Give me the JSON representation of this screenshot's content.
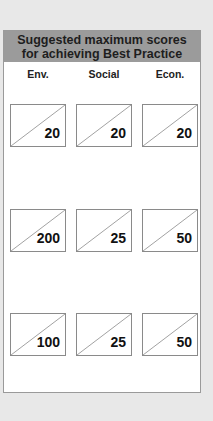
{
  "header": {
    "line1": "Suggested maximum scores",
    "line2": "for achieving Best Practice"
  },
  "columns": [
    "Env.",
    "Social",
    "Econ."
  ],
  "rows": [
    [
      "20",
      "20",
      "20"
    ],
    [
      "200",
      "25",
      "50"
    ],
    [
      "100",
      "25",
      "50"
    ]
  ],
  "colors": {
    "header_bg": "#9b9b9b",
    "page_bg": "#e8e8e8",
    "box_border": "#8a8a8a"
  }
}
